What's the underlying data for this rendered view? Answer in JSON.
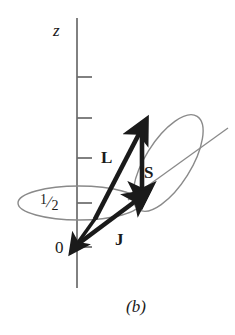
{
  "figure": {
    "caption": "(b)",
    "axis_label": "z",
    "origin_label": "0",
    "half_label_numerator": "1",
    "half_label_slash": "/",
    "half_label_denominator": "2",
    "vectors": [
      {
        "name": "L",
        "label": "L"
      },
      {
        "name": "S",
        "label": "S"
      },
      {
        "name": "J",
        "label": "J"
      }
    ],
    "colors": {
      "ink": "#1a1a1a",
      "axis": "#6b6b6b",
      "thin_line": "#8a8a8a",
      "background": "#ffffff"
    },
    "geometry": {
      "axis_x": 77,
      "axis_top_y": 18,
      "axis_bottom_y": 288,
      "origin_y": 247,
      "half_level_y": 203,
      "tick_ys": [
        77,
        118,
        158,
        203,
        247
      ],
      "L_tail": [
        95,
        219
      ],
      "L_tip": [
        142,
        128
      ],
      "S_tail": [
        142,
        130
      ],
      "S_tip": [
        142,
        197
      ],
      "J_tail": [
        73,
        247
      ],
      "J_tip": [
        141,
        197
      ],
      "down_arrow_tail": [
        96,
        218
      ],
      "down_arrow_tip": [
        73,
        247
      ],
      "horizontal_ellipse_center": [
        79,
        203
      ],
      "horizontal_ellipse_rx": 61,
      "horizontal_ellipse_ry": 17,
      "tilted_ellipse_center": [
        168,
        163
      ],
      "tilted_ellipse_rx": 55,
      "tilted_ellipse_ry": 23,
      "tilted_ellipse_rotation_deg": -58,
      "tilt_axis_start": [
        128,
        200
      ],
      "tilt_axis_end": [
        228,
        128
      ]
    }
  }
}
